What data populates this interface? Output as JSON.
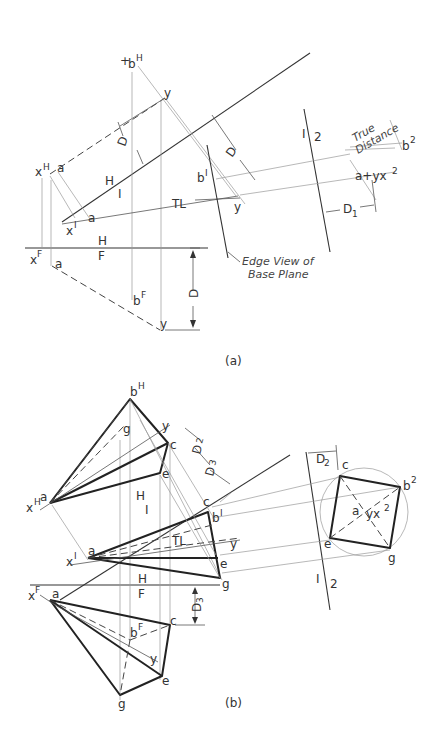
{
  "figure_a": {
    "caption": "(a)",
    "points": {
      "bH": "b",
      "bH_sup": "H",
      "y_top": "y",
      "xH": "x",
      "xH_sup": "H",
      "a_H": "a",
      "x1": "x",
      "x1_sup": "I",
      "a_1": "a",
      "b1": "b",
      "b1_sup": "I",
      "y_1": "y",
      "xF": "x",
      "xF_sup": "F",
      "a_F": "a",
      "bF": "b",
      "bF_sup": "F",
      "y_F": "y",
      "a_2": "a+yx",
      "a_2_sup": "2",
      "b2": "b",
      "b2_sup": "2"
    },
    "fold_lines": {
      "H_1_top": "H",
      "H_1_bottom": "I",
      "H_F_top": "H",
      "H_F_bottom": "F",
      "ref_1": "I",
      "ref_2": "2"
    },
    "dims": {
      "D_top": "D",
      "D_right": "D",
      "D_front": "D",
      "D1": "D",
      "D1_sub": "1",
      "TL": "TL"
    },
    "annotations": {
      "true_distance_1": "True",
      "true_distance_2": "Distance",
      "edge_view_1": "Edge View of",
      "edge_view_2": "Base Plane"
    }
  },
  "figure_b": {
    "caption": "(b)",
    "points": {
      "bH": "b",
      "bH_sup": "H",
      "g_H": "g",
      "y_H": "y",
      "c_H": "c",
      "e_H": "e",
      "a_H": "a",
      "xH": "x",
      "xH_sup": "H",
      "c_1": "c",
      "b1": "b",
      "b1_sup": "I",
      "y_1": "y",
      "a_1": "a",
      "x1": "x",
      "x1_sup": "I",
      "e_1": "e",
      "g_1": "g",
      "xF": "x",
      "xF_sup": "F",
      "a_F": "a",
      "bF": "b",
      "bF_sup": "F",
      "c_F": "c",
      "y_F": "y",
      "e_F": "e",
      "g_F": "g",
      "c_2": "c",
      "b2": "b",
      "b2_sup": "2",
      "a_2": "a",
      "yx2": "yx",
      "yx2_sup": "2",
      "e_2": "e",
      "g_2": "g"
    },
    "fold_lines": {
      "H_1_top": "H",
      "H_1_bottom": "I",
      "H_F_top": "H",
      "H_F_bottom": "F",
      "ref_1": "I",
      "ref_2": "2"
    },
    "dims": {
      "D2_a": "D",
      "D2_a_sub": "2",
      "D3_a": "D",
      "D3_a_sub": "3",
      "D3_b": "D",
      "D3_b_sub": "3",
      "D2_b": "D",
      "D2_b_sub": "2",
      "TL": "TL"
    }
  }
}
